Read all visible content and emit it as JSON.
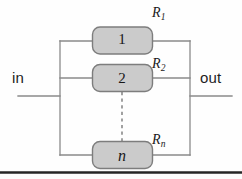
{
  "figure": {
    "type": "circuit-diagram",
    "background_color": "#fefefe",
    "line_color": "#8a8a8a",
    "box_fill_color": "#cbcbcb",
    "box_stroke_color": "#7d7d7d",
    "text_color": "#1b1b1b",
    "rule_color": "#262626"
  },
  "terminals": {
    "input_label": "in",
    "output_label": "out"
  },
  "branches": [
    {
      "number": "1",
      "resistor_symbol": "R",
      "resistor_subscript": "1"
    },
    {
      "number": "2",
      "resistor_symbol": "R",
      "resistor_subscript": "2"
    },
    {
      "number": "n",
      "resistor_symbol": "R",
      "resistor_subscript": "n"
    }
  ],
  "continuation": {
    "style": "vertical-dashed-line",
    "meaning": "additional branches omitted"
  },
  "footer_rule": {
    "present": true,
    "style": "horizontal-dark-rule"
  }
}
